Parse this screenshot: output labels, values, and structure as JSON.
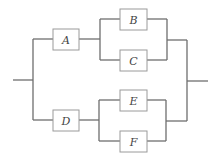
{
  "diagram": {
    "type": "reliability-block-diagram",
    "colors": {
      "wire": "#6e6e6e",
      "box_border": "#9a9a9a",
      "label": "#444444",
      "background": "#ffffff"
    },
    "blocks": [
      {
        "id": "A",
        "label": "A"
      },
      {
        "id": "B",
        "label": "B"
      },
      {
        "id": "C",
        "label": "C"
      },
      {
        "id": "D",
        "label": "D"
      },
      {
        "id": "E",
        "label": "E"
      },
      {
        "id": "F",
        "label": "F"
      }
    ],
    "structure": {
      "upper_branch": {
        "series": [
          "A",
          {
            "parallel": [
              "B",
              "C"
            ]
          }
        ]
      },
      "lower_branch": {
        "series": [
          "D",
          {
            "parallel": [
              "E",
              "F"
            ]
          }
        ]
      }
    }
  }
}
